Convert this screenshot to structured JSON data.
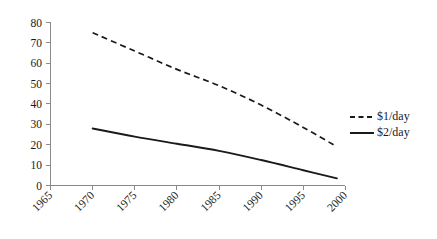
{
  "chart_data": {
    "type": "line",
    "title": "",
    "xlabel": "",
    "ylabel": "",
    "xlim": [
      1965,
      2000
    ],
    "ylim": [
      0,
      80
    ],
    "grid": false,
    "legend_position": "right",
    "x_ticks": [
      "1965",
      "1970",
      "1975",
      "1980",
      "1985",
      "1990",
      "1995",
      "2000"
    ],
    "y_ticks": [
      "0",
      "10",
      "20",
      "30",
      "40",
      "50",
      "60",
      "70",
      "80"
    ],
    "series": [
      {
        "name": "$1/day",
        "style": "dashed",
        "color": "#1a1a1a",
        "x": [
          1970,
          1975,
          1980,
          1985,
          1990,
          1995,
          1999
        ],
        "values": [
          28,
          24,
          20.5,
          17,
          12.5,
          7.5,
          3.5
        ]
      },
      {
        "name": "$2/day",
        "style": "solid",
        "color": "#1a1a1a",
        "x": [
          1970,
          1975,
          1980,
          1985,
          1990,
          1995,
          1999
        ],
        "values": [
          75,
          66,
          57,
          49,
          39.5,
          28.5,
          19
        ]
      }
    ]
  },
  "legend": {
    "entries": [
      {
        "label": "$1/day",
        "style": "dashed"
      },
      {
        "label": "$2/day",
        "style": "solid"
      }
    ]
  },
  "axes": {
    "x_tick_labels": [
      "1965",
      "1970",
      "1975",
      "1980",
      "1985",
      "1990",
      "1995",
      "2000"
    ],
    "y_tick_labels": [
      "80",
      "70",
      "60",
      "50",
      "40",
      "30",
      "20",
      "10",
      "0"
    ]
  },
  "colors": {
    "line": "#1a1a1a",
    "axis": "#8a8a8a",
    "background": "#ffffff"
  }
}
